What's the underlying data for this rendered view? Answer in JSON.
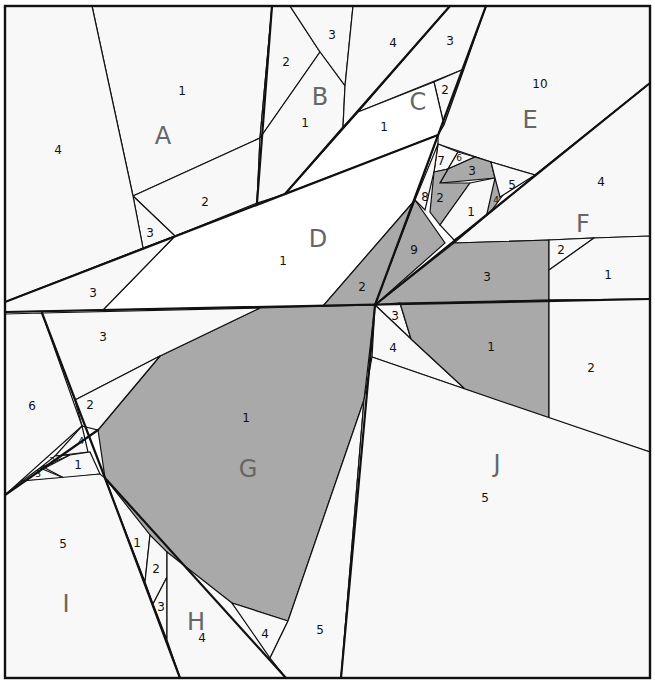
{
  "colors": {
    "light": "#f8f8f8",
    "white": "#ffffff",
    "gray": "#a9a9a9",
    "line": "#111111",
    "section_label": "#666666"
  },
  "sections": [
    {
      "id": "A",
      "label": "A",
      "x": 163,
      "y": 137
    },
    {
      "id": "B",
      "label": "B",
      "x": 320,
      "y": 98
    },
    {
      "id": "C",
      "label": "C",
      "x": 418,
      "y": 103
    },
    {
      "id": "D",
      "label": "D",
      "x": 318,
      "y": 240
    },
    {
      "id": "E",
      "label": "E",
      "x": 530,
      "y": 121
    },
    {
      "id": "F",
      "label": "F",
      "x": 583,
      "y": 225
    },
    {
      "id": "G",
      "label": "G",
      "x": 248,
      "y": 470
    },
    {
      "id": "H",
      "label": "H",
      "x": 196,
      "y": 623
    },
    {
      "id": "I",
      "label": "I",
      "x": 66,
      "y": 605
    },
    {
      "id": "J",
      "label": "J",
      "x": 497,
      "y": 465
    }
  ],
  "pieces": [
    {
      "section": "A",
      "num": "1",
      "x": 182,
      "y": 91,
      "fill": "light",
      "points": "92,6 272,6 260,138 133,196"
    },
    {
      "section": "A",
      "num": "2",
      "x": 205,
      "y": 202,
      "fill": "light",
      "points": "133,196 260,138 257,203 175,236"
    },
    {
      "section": "A",
      "num": "3",
      "x": 150,
      "y": 233,
      "fill": "light",
      "points": "133,196 175,236 143,248"
    },
    {
      "section": "A",
      "num": "4",
      "x": 58,
      "y": 150,
      "fill": "light",
      "points": "5,6 92,6 133,196 143,248 5,302"
    },
    {
      "section": "B",
      "num": "2",
      "x": 286,
      "y": 62,
      "fill": "light",
      "points": "272,6 290,6 320,52 260,138"
    },
    {
      "section": "B",
      "num": "3",
      "x": 332,
      "y": 35,
      "fill": "light",
      "points": "290,6 353,6 345,86 320,52"
    },
    {
      "section": "B",
      "num": "1",
      "x": 305,
      "y": 123,
      "fill": "light",
      "points": "320,52 345,86 343,127 285,194 257,203 260,138"
    },
    {
      "section": "C",
      "num": "4",
      "x": 393,
      "y": 43,
      "fill": "light",
      "points": "353,6 450,6 358,112 343,127 345,86"
    },
    {
      "section": "C",
      "num": "3",
      "x": 450,
      "y": 41,
      "fill": "light",
      "points": "450,6 486,6 464,69 358,112"
    },
    {
      "section": "C",
      "num": "2",
      "x": 445,
      "y": 90,
      "fill": "light",
      "points": "434,82 464,69 444,125"
    },
    {
      "section": "C",
      "num": "1",
      "x": 384,
      "y": 127,
      "fill": "white",
      "points": "358,112 434,82 444,125 438,135 285,194"
    },
    {
      "section": "D",
      "num": "1",
      "x": 283,
      "y": 261,
      "fill": "white",
      "points": "175,236 438,135 415,200 323,306 103,310"
    },
    {
      "section": "D",
      "num": "3",
      "x": 93,
      "y": 293,
      "fill": "light",
      "points": "5,302 175,236 103,310 5,312"
    },
    {
      "section": "D",
      "num": "2",
      "x": 362,
      "y": 287,
      "fill": "gray",
      "points": "415,200 375,305 323,306"
    },
    {
      "section": "D",
      "num": "9",
      "x": 414,
      "y": 250,
      "fill": "gray",
      "points": "415,200 445,243 375,305"
    },
    {
      "section": "E",
      "num": "10",
      "x": 540,
      "y": 84,
      "fill": "light",
      "points": "486,6 650,6 650,83 535,175 491,162 438,144 438,135 444,125 464,69"
    },
    {
      "section": "E",
      "num": "7",
      "x": 441,
      "y": 161,
      "fill": "light",
      "points": "438,144 458,152 448,169 434,172"
    },
    {
      "section": "E",
      "num": "6",
      "x": 459,
      "y": 158,
      "fill": "light",
      "points": "458,152 475,157 448,169"
    },
    {
      "section": "E",
      "num": "3",
      "x": 472,
      "y": 171,
      "fill": "gray",
      "points": "448,169 475,157 491,162 495,178 440,183"
    },
    {
      "section": "E",
      "num": "8",
      "x": 425,
      "y": 197,
      "fill": "light",
      "points": "438,144 434,172 425,210 415,200"
    },
    {
      "section": "E",
      "num": "2",
      "x": 440,
      "y": 198,
      "fill": "gray",
      "points": "434,172 448,169 440,183 470,183 440,225 430,212"
    },
    {
      "section": "E",
      "num": "1",
      "x": 471,
      "y": 212,
      "fill": "light",
      "points": "470,183 495,178 500,196 487,218 454,240 440,225"
    },
    {
      "section": "E",
      "num": "4",
      "x": 496,
      "y": 200,
      "fill": "gray",
      "points": "495,178 503,195 486,218"
    },
    {
      "section": "E",
      "num": "5",
      "x": 512,
      "y": 185,
      "fill": "light",
      "points": "491,162 535,175 500,197 495,178"
    },
    {
      "section": "F",
      "num": "4",
      "x": 601,
      "y": 182,
      "fill": "light",
      "points": "650,83 650,236 594,238 549,240 454,243 535,175"
    },
    {
      "section": "F",
      "num": "3",
      "x": 487,
      "y": 277,
      "fill": "gray",
      "points": "454,243 549,240 549,300 375,305"
    },
    {
      "section": "F",
      "num": "2",
      "x": 561,
      "y": 250,
      "fill": "light",
      "points": "549,240 594,238 549,270"
    },
    {
      "section": "F",
      "num": "1",
      "x": 608,
      "y": 275,
      "fill": "light",
      "points": "594,238 650,236 650,299 549,300 549,270"
    },
    {
      "section": "G",
      "num": "1",
      "x": 246,
      "y": 418,
      "fill": "gray",
      "points": "260,308 375,305 364,400 288,621 232,603 161,559 105,478 98,430 160,356"
    },
    {
      "section": "G",
      "num": "3",
      "x": 103,
      "y": 337,
      "fill": "light",
      "points": "42,313 260,308 160,356 75,400"
    },
    {
      "section": "G",
      "num": "2",
      "x": 90,
      "y": 405,
      "fill": "light",
      "points": "75,400 160,356 98,430 82,426"
    },
    {
      "section": "I",
      "num": "6",
      "x": 32,
      "y": 406,
      "fill": "light",
      "points": "5,314 42,313 82,426 5,495"
    },
    {
      "section": "I",
      "num": "4",
      "x": 81,
      "y": 441,
      "fill": "light",
      "points": "82,426 88,452 55,456"
    },
    {
      "section": "I",
      "num": "2",
      "x": 52,
      "y": 461,
      "fill": "light",
      "points": "55,456 70,455 40,468"
    },
    {
      "section": "I",
      "num": "1",
      "x": 78,
      "y": 465,
      "fill": "light",
      "points": "70,455 90,452 100,474 64,478 45,468"
    },
    {
      "section": "I",
      "num": "3",
      "x": 38,
      "y": 474,
      "fill": "light",
      "points": "40,468 64,478 22,481"
    },
    {
      "section": "I",
      "num": "5",
      "x": 63,
      "y": 544,
      "fill": "light",
      "points": "5,495 22,481 100,474 105,478 180,678 5,678"
    },
    {
      "section": "H",
      "num": "1",
      "x": 137,
      "y": 543,
      "fill": "light",
      "points": "105,478 150,535 145,582"
    },
    {
      "section": "H",
      "num": "2",
      "x": 156,
      "y": 569,
      "fill": "light",
      "points": "150,535 167,552 167,577 153,604 145,582"
    },
    {
      "section": "H",
      "num": "3",
      "x": 161,
      "y": 607,
      "fill": "light",
      "points": "153,604 167,577 167,640"
    },
    {
      "section": "H",
      "num": "4",
      "x": 202,
      "y": 638,
      "fill": "light",
      "points": "167,552 232,603 286,678 180,678 167,640"
    },
    {
      "section": "H",
      "num": "4b",
      "label": "4",
      "x": 265,
      "y": 634,
      "fill": "light",
      "points": "232,603 288,621 270,658"
    },
    {
      "section": "J",
      "num": "5",
      "x": 320,
      "y": 630,
      "fill": "light",
      "points": "364,400 341,678 286,678 270,658 288,621"
    },
    {
      "section": "J",
      "num": "3",
      "x": 395,
      "y": 316,
      "fill": "light",
      "points": "375,305 400,303 411,339"
    },
    {
      "section": "J",
      "num": "4",
      "x": 393,
      "y": 348,
      "fill": "light",
      "points": "375,305 411,339 465,389 372,357"
    },
    {
      "section": "J",
      "num": "1",
      "x": 491,
      "y": 347,
      "fill": "gray",
      "points": "400,303 549,300 549,419 465,389 411,339"
    },
    {
      "section": "J",
      "num": "2",
      "x": 591,
      "y": 368,
      "fill": "light",
      "points": "549,300 650,299 650,452 549,419"
    },
    {
      "section": "J",
      "num": "5b",
      "label": "5",
      "x": 485,
      "y": 498,
      "fill": "light",
      "points": "372,357 465,389 650,452 650,678 341,678 364,400"
    }
  ],
  "seams": [
    "5,302 438,135",
    "5,312 650,299",
    "375,305 650,83",
    "375,305 341,678",
    "375,305 486,6",
    "285,194 450,6",
    "257,203 272,6",
    "42,313 105,478 180,678",
    "105,478 286,678",
    "5,495 98,430"
  ],
  "border": {
    "x": 5,
    "y": 6,
    "width": 645,
    "height": 672
  }
}
